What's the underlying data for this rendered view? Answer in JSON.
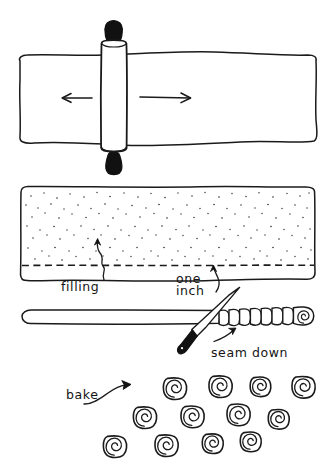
{
  "illustration": {
    "title": "Cinnamon roll preparation steps",
    "ink_color": "#1a1a1a",
    "background_color": "#ffffff",
    "panels": [
      {
        "id": "panel-roll-dough",
        "step_number": 1,
        "description": "Rolling pin flattening a rectangle of dough, arrows showing rolling direction",
        "labels": []
      },
      {
        "id": "panel-spread-filling",
        "step_number": 2,
        "description": "Dough rectangle covered with stippled filling, dashed line one inch from the bottom edge",
        "labels": [
          "filling",
          "one",
          "inch"
        ]
      },
      {
        "id": "panel-slice-log",
        "step_number": 3,
        "description": "Rolled dough log being cut into slices with a knife",
        "labels": [
          "seam down"
        ]
      },
      {
        "id": "panel-bake-rolls",
        "step_number": 4,
        "description": "Twelve cut spiral rolls arranged in three rows ready for baking",
        "labels": [
          "bake"
        ]
      }
    ],
    "labels": {
      "filling": "filling",
      "one": "one",
      "inch": "inch",
      "seam_down": "seam down",
      "bake": "bake"
    },
    "rolls": {
      "row_1_count": 4,
      "row_2_count": 4,
      "row_3_count": 4,
      "total_count": 12
    }
  }
}
